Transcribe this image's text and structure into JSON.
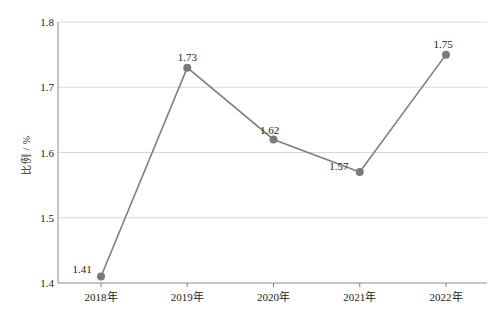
{
  "chart_data": {
    "type": "line",
    "title": "",
    "xlabel": "",
    "ylabel": "比例 / %",
    "categories": [
      "2018年",
      "2019年",
      "2020年",
      "2021年",
      "2022年"
    ],
    "values": [
      1.41,
      1.73,
      1.62,
      1.57,
      1.75
    ],
    "point_labels": [
      "1.41",
      "1.73",
      "1.62",
      "1.57",
      "1.75"
    ],
    "ylim": [
      1.4,
      1.8
    ],
    "yticks": [
      "1.4",
      "1.5",
      "1.6",
      "1.7",
      "1.8"
    ],
    "ytick_values": [
      1.4,
      1.5,
      1.6,
      1.7,
      1.8
    ],
    "grid": "horizontal",
    "legend": "none",
    "series": [
      {
        "name": "比例 / %",
        "values": [
          1.41,
          1.73,
          1.62,
          1.57,
          1.75
        ]
      }
    ],
    "colors": {
      "line": "#808080",
      "marker": "#7a7a7a",
      "grid": "#d9d9d9",
      "axis": "#808080",
      "text": "#1c1c1c",
      "background": "#ffffff"
    },
    "label_offsets": [
      {
        "dx": -19,
        "dy": -13
      },
      {
        "dx": 0,
        "dy": -17
      },
      {
        "dx": -4,
        "dy": -15
      },
      {
        "dx": -21,
        "dy": -12
      },
      {
        "dx": -3,
        "dy": -17
      }
    ]
  }
}
